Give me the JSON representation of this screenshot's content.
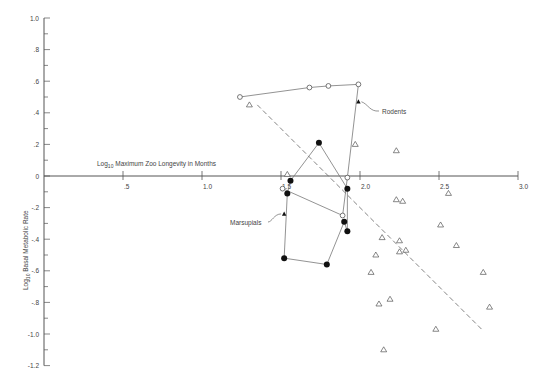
{
  "chart_data": {
    "type": "scatter",
    "title": "",
    "xlabel": "Log10 Maximum Zoo Longevity in Months",
    "ylabel": "Log10 Basal Metabolic Rate",
    "xlim": [
      0,
      3.0
    ],
    "ylim": [
      -1.2,
      1.0
    ],
    "x_ticks": [
      ".5",
      "1.0",
      "1.5",
      "2.0",
      "2.5",
      "3.0"
    ],
    "x_tick_values": [
      0.5,
      1.0,
      1.5,
      2.0,
      2.5,
      3.0
    ],
    "y_ticks": [
      "1.0",
      ".8",
      ".6",
      ".4",
      ".2",
      "0",
      "-.2",
      "-.4",
      "-.6",
      "-.8",
      "-1.0",
      "-1.2"
    ],
    "y_tick_values": [
      1.0,
      0.8,
      0.6,
      0.4,
      0.2,
      0,
      -0.2,
      -0.4,
      -0.6,
      -0.8,
      -1.0,
      -1.2
    ],
    "grid": false,
    "legend": null,
    "annotations": [
      {
        "text": "Rodents",
        "x": 2.14,
        "y": 0.41,
        "points_to": [
          1.99,
          0.47
        ]
      },
      {
        "text": "Marsupials",
        "x": 1.18,
        "y": -0.3,
        "points_to": [
          1.52,
          -0.24
        ]
      }
    ],
    "series": [
      {
        "name": "Rodents (open circles)",
        "marker": "open-circle",
        "x": [
          1.24,
          1.68,
          1.8,
          1.99,
          1.92,
          1.89,
          1.51
        ],
        "y": [
          0.5,
          0.56,
          0.57,
          0.58,
          -0.01,
          -0.25,
          -0.08
        ],
        "connected": true
      },
      {
        "name": "Rodents (filled triangle)",
        "marker": "filled-triangle",
        "x": [
          1.99
        ],
        "y": [
          0.47
        ]
      },
      {
        "name": "Marsupials (filled circles)",
        "marker": "filled-circle",
        "x": [
          1.56,
          1.74,
          1.92,
          1.92,
          1.9,
          1.79,
          1.52,
          1.54
        ],
        "y": [
          -0.03,
          0.21,
          -0.08,
          -0.35,
          -0.29,
          -0.56,
          -0.52,
          -0.11
        ],
        "connected": true
      },
      {
        "name": "Marsupials (filled triangle)",
        "marker": "filled-triangle",
        "x": [
          1.52
        ],
        "y": [
          -0.24
        ]
      },
      {
        "name": "Other mammals (open triangles)",
        "marker": "open-triangle",
        "x": [
          1.3,
          1.54,
          1.97,
          2.23,
          2.23,
          2.27,
          2.56,
          2.51,
          2.14,
          2.25,
          2.25,
          2.29,
          2.1,
          2.07,
          2.78,
          2.12,
          2.19,
          2.82,
          2.48,
          2.15,
          2.61
        ],
        "y": [
          0.45,
          0.01,
          0.2,
          0.16,
          -0.15,
          -0.16,
          -0.11,
          -0.31,
          -0.39,
          -0.41,
          -0.48,
          -0.47,
          -0.5,
          -0.61,
          -0.61,
          -0.81,
          -0.78,
          -0.83,
          -0.97,
          -1.1,
          -0.44
        ]
      },
      {
        "name": "Regression line",
        "marker": "dashed-line",
        "x": [
          1.35,
          2.77
        ],
        "y": [
          0.45,
          -0.97
        ]
      }
    ]
  },
  "labels": {
    "x_axis_title_main": "Log",
    "x_axis_title_sub": "10",
    "x_axis_title_rest": " Maximum Zoo Longevity in Months",
    "y_axis_title_main": "Log",
    "y_axis_title_sub": "10",
    "y_axis_title_rest": " Basal Metabolic Rate",
    "rodents": "Rodents",
    "marsupials": "Marsupials"
  }
}
